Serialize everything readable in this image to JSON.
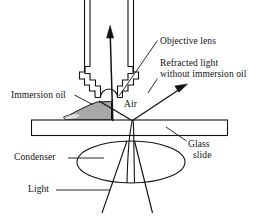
{
  "figure": {
    "background_color": "#ffffff",
    "ink_color": "#121212",
    "oil_fill_color": "#a8a8a8",
    "oil_highlight_color": "#d8d8d8",
    "width": 261,
    "height": 221
  },
  "labels": {
    "objective_lens": "Objective lens",
    "refracted_light_line1": "Refracted light",
    "refracted_light_line2": "without immersion oil",
    "immersion_oil": "Immersion oil",
    "air": "Air",
    "glass_line1": "Glass",
    "glass_line2": "slide",
    "condenser": "Condenser",
    "light": "Light"
  },
  "parts": {
    "objective_barrel": "objective-lens-barrel",
    "lens_element": "lens-dome",
    "oil_drop": "immersion-oil-drop",
    "glass_slide": "glass-slide",
    "condenser_lens": "condenser-ellipse",
    "axial_ray": "axial-light-ray-arrow",
    "refracted_ray": "refracted-light-ray-arrow",
    "illumination_rays": "illumination-ray-cone"
  }
}
